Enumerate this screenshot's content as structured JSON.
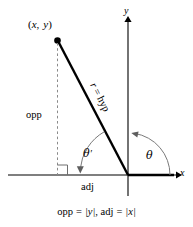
{
  "figure": {
    "type": "diagram",
    "background_color": "#ffffff",
    "ink_color": "#000000",
    "point_label": {
      "open_paren": "(",
      "x_var": "x",
      "comma": ",",
      "y_var": "y",
      "close_paren": ")",
      "full_text": "(x, y)"
    },
    "axis_labels": {
      "x": "x",
      "y": "y"
    },
    "side_labels": {
      "opposite": "opp",
      "adjacent": "adj",
      "hypotenuse_r": "r",
      "hypotenuse_eq": "=",
      "hypotenuse_hyp": "hyp",
      "hypotenuse_full": "r = hyp"
    },
    "angle_labels": {
      "reference_angle": "θ",
      "reference_angle_prime": "′",
      "standard_angle": "θ",
      "reference_full": "θ′",
      "standard_full": "θ"
    },
    "caption": {
      "opp_word": "opp",
      "equals_1": "=",
      "abs_y": "|y|",
      "comma": ",",
      "adj_word": "adj",
      "equals_2": "=",
      "abs_x": "|x|",
      "full_text": "opp = |y|, adj = |x|"
    },
    "geometry": {
      "origin_x": 128,
      "origin_y": 175,
      "point_x": 57,
      "point_y": 40,
      "y_axis_top": 20,
      "y_axis_bottom": 196,
      "x_axis_left": 8,
      "x_axis_right": 178
    }
  }
}
